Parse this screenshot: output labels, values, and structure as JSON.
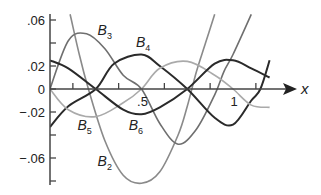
{
  "chart_data": {
    "type": "line",
    "title": "",
    "xlabel": "x",
    "ylabel": "",
    "xlim": [
      0,
      1.3
    ],
    "ylim": [
      -0.085,
      0.065
    ],
    "grid": false,
    "legend": "inline labels",
    "x_tick_labels": [
      {
        "value": 0.5,
        "label": ".5"
      },
      {
        "value": 1,
        "label": "1"
      }
    ],
    "x_ticks": [
      0.125,
      0.375,
      0.625,
      0.875,
      1.125
    ],
    "y_tick_labels": [
      {
        "value": 0.06,
        "label": ".06"
      },
      {
        "value": 0.02,
        "label": ".02"
      },
      {
        "value": 0,
        "label": "0"
      },
      {
        "value": -0.02,
        "label": "−.02"
      },
      {
        "value": -0.06,
        "label": "−.06"
      }
    ],
    "y_ticks": [
      0.06,
      0.04,
      0.02,
      0,
      -0.02,
      -0.04,
      -0.06,
      -0.08
    ],
    "series": [
      {
        "name": "B2",
        "color": "#8a8a8a",
        "label_pos": [
          0.26,
          -0.067
        ],
        "x": [
          0.11,
          0.16,
          0.21,
          0.3,
          0.4,
          0.5,
          0.6,
          0.7,
          0.75,
          0.8,
          0.85,
          0.9
        ],
        "y": [
          0.065,
          0.03,
          0.0,
          -0.045,
          -0.075,
          -0.082,
          -0.072,
          -0.04,
          -0.015,
          0.015,
          0.04,
          0.065
        ]
      },
      {
        "name": "B3",
        "color": "#6f6f6f",
        "label_pos": [
          0.26,
          0.047
        ],
        "x": [
          0.0,
          0.1,
          0.2,
          0.3,
          0.4,
          0.5,
          0.6,
          0.7,
          0.8,
          0.9,
          0.95,
          1.0,
          1.1
        ],
        "y": [
          0.0,
          0.042,
          0.048,
          0.035,
          0.012,
          0.0,
          -0.03,
          -0.048,
          -0.035,
          -0.005,
          0.015,
          0.03,
          0.065
        ]
      },
      {
        "name": "B4",
        "color": "#2a2a2a",
        "label_pos": [
          0.47,
          0.037
        ],
        "x": [
          0.0,
          0.1,
          0.25,
          0.35,
          0.5,
          0.6,
          0.75,
          0.9,
          1.0,
          1.1,
          1.15,
          1.2
        ],
        "y": [
          -0.033,
          -0.015,
          0.0,
          0.022,
          0.03,
          0.02,
          0.0,
          -0.025,
          -0.031,
          -0.01,
          0.0,
          0.025
        ]
      },
      {
        "name": "B5",
        "color": "#aaaaaa",
        "label_pos": [
          0.15,
          -0.036
        ],
        "x": [
          0.0,
          0.1,
          0.25,
          0.4,
          0.5,
          0.6,
          0.75,
          0.9,
          1.0,
          1.1,
          1.2
        ],
        "y": [
          0.0,
          -0.018,
          -0.024,
          -0.012,
          0.0,
          0.018,
          0.024,
          0.012,
          0.0,
          -0.014,
          -0.016
        ]
      },
      {
        "name": "B6",
        "color": "#2a2a2a",
        "label_pos": [
          0.43,
          -0.036
        ],
        "x": [
          0.0,
          0.1,
          0.25,
          0.4,
          0.5,
          0.6,
          0.75,
          0.9,
          1.0,
          1.1,
          1.2
        ],
        "y": [
          0.025,
          0.018,
          0.0,
          -0.018,
          -0.022,
          -0.016,
          0.0,
          0.022,
          0.025,
          0.018,
          0.01
        ]
      }
    ]
  }
}
